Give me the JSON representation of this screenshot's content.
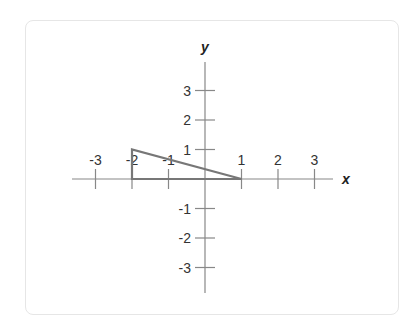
{
  "diagram": {
    "type": "coordinate-plane",
    "axes": {
      "x_label": "x",
      "y_label": "y"
    },
    "x_ticks": [
      {
        "value": -3,
        "label": "-3"
      },
      {
        "value": -2,
        "label": "-2"
      },
      {
        "value": -1,
        "label": "-1"
      },
      {
        "value": 1,
        "label": "1"
      },
      {
        "value": 2,
        "label": "2"
      },
      {
        "value": 3,
        "label": "3"
      }
    ],
    "y_ticks": [
      {
        "value": 3,
        "label": "3"
      },
      {
        "value": 2,
        "label": "2"
      },
      {
        "value": 1,
        "label": "1"
      },
      {
        "value": -1,
        "label": "-1"
      },
      {
        "value": -2,
        "label": "-2"
      },
      {
        "value": -3,
        "label": "-3"
      }
    ],
    "shapes": [
      {
        "type": "triangle",
        "vertices": [
          [
            -2,
            0
          ],
          [
            -2,
            1
          ],
          [
            1,
            0
          ]
        ],
        "stroke": "#777777"
      }
    ],
    "colors": {
      "axis": "#888888",
      "shape": "#777777",
      "text": "#333333"
    }
  }
}
